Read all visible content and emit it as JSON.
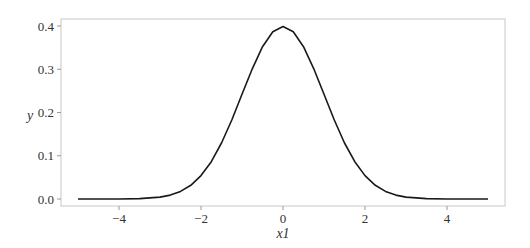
{
  "chart_data": {
    "type": "line",
    "title": "",
    "xlabel": "x1",
    "ylabel": "y",
    "xlim": [
      -5.5,
      5.5
    ],
    "ylim": [
      -0.017,
      0.42
    ],
    "grid": false,
    "legend": null,
    "xticks": [
      "-4",
      "-2",
      "0",
      "2",
      "4"
    ],
    "yticks": [
      "0.0",
      "0.1",
      "0.2",
      "0.3",
      "0.4"
    ],
    "series": [
      {
        "name": "y",
        "color": "#1a1a1a",
        "x": [
          -5,
          -4.5,
          -4,
          -3.5,
          -3,
          -2.75,
          -2.5,
          -2.25,
          -2,
          -1.75,
          -1.5,
          -1.25,
          -1,
          -0.75,
          -0.5,
          -0.25,
          0,
          0.25,
          0.5,
          0.75,
          1,
          1.25,
          1.5,
          1.75,
          2,
          2.25,
          2.5,
          2.75,
          3,
          3.5,
          4,
          4.5,
          5
        ],
        "values": [
          0.0,
          0.0,
          0.0001,
          0.0009,
          0.0044,
          0.0091,
          0.0175,
          0.0317,
          0.054,
          0.0863,
          0.1295,
          0.1826,
          0.242,
          0.3011,
          0.3521,
          0.3867,
          0.3989,
          0.3867,
          0.3521,
          0.3011,
          0.242,
          0.1826,
          0.1295,
          0.0863,
          0.054,
          0.0317,
          0.0175,
          0.0091,
          0.0044,
          0.0009,
          0.0001,
          0.0,
          0.0
        ]
      }
    ]
  }
}
